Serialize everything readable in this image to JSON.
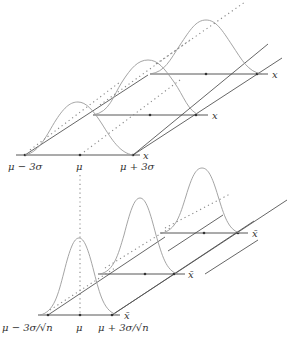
{
  "figure": {
    "top": {
      "axis_label": "x",
      "tick_labels": [
        "μ − 3σ",
        "μ",
        "μ + 3σ"
      ],
      "copies": 3
    },
    "bottom": {
      "axis_label": "x̄",
      "tick_labels": [
        "μ − 3σ/√n",
        "μ",
        "μ + 3σ/√n"
      ],
      "copies": 3
    },
    "colors": {
      "axis": "#444444",
      "curve": "#9a9a9a",
      "dotted": "#888888"
    }
  }
}
